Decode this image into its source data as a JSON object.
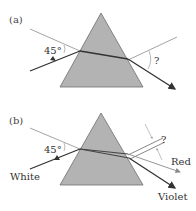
{
  "figure": {
    "panels": [
      {
        "id": "a",
        "label": "(a)",
        "incident_angle_label": "45°",
        "exit_angle_label": "?",
        "rays": [
          "incident",
          "refracted-inside",
          "emergent"
        ]
      },
      {
        "id": "b",
        "label": "(b)",
        "incident_angle_label": "45°",
        "exit_angle_label": "?",
        "incident_ray_label": "White",
        "emergent_ray_labels": [
          "Red",
          "Violet"
        ]
      }
    ]
  },
  "colors": {
    "prism_fill": "#b3b3b3",
    "prism_stroke": "#6e6e6e",
    "ray": "#333333",
    "normal_line": "#666666",
    "angle_marker": "#999999"
  }
}
